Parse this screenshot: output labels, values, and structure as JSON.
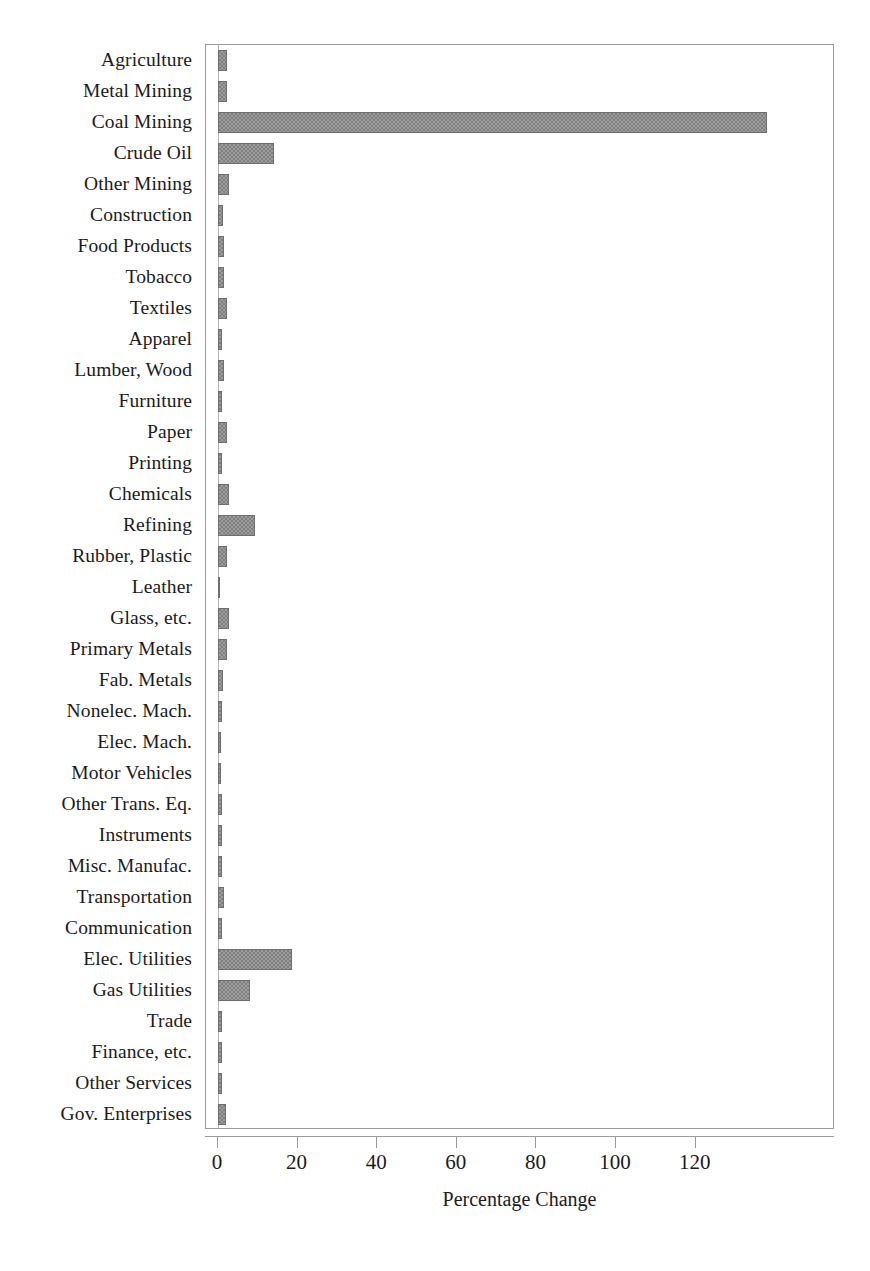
{
  "chart_data": {
    "type": "bar",
    "orientation": "horizontal",
    "title": "",
    "xlabel": "Percentage Change",
    "ylabel": "",
    "xlim": [
      -3,
      155
    ],
    "xticks": [
      0,
      20,
      40,
      60,
      80,
      100,
      120
    ],
    "grid": false,
    "legend": null,
    "bar_color": "#808080",
    "categories": [
      "Agriculture",
      "Metal Mining",
      "Coal Mining",
      "Crude Oil",
      "Other Mining",
      "Construction",
      "Food Products",
      "Tobacco",
      "Textiles",
      "Apparel",
      "Lumber, Wood",
      "Furniture",
      "Paper",
      "Printing",
      "Chemicals",
      "Refining",
      "Rubber, Plastic",
      "Leather",
      "Glass, etc.",
      "Primary Metals",
      "Fab. Metals",
      "Nonelec. Mach.",
      "Elec. Mach.",
      "Motor Vehicles",
      "Other Trans. Eq.",
      "Instruments",
      "Misc. Manufac.",
      "Transportation",
      "Communication",
      "Elec. Utilities",
      "Gas Utilities",
      "Trade",
      "Finance, etc.",
      "Other Services",
      "Gov. Enterprises"
    ],
    "values": [
      2.2,
      2.4,
      138.0,
      14.0,
      2.8,
      1.3,
      1.5,
      1.6,
      2.4,
      0.9,
      1.4,
      1.1,
      2.3,
      1.0,
      2.7,
      9.3,
      2.3,
      0.4,
      2.7,
      2.4,
      1.2,
      1.0,
      0.8,
      0.8,
      1.1,
      1.0,
      0.9,
      1.5,
      1.1,
      18.5,
      8.0,
      1.0,
      0.9,
      1.0,
      1.9
    ]
  },
  "axis": {
    "x_title": "Percentage Change",
    "tick_labels": [
      "0",
      "20",
      "40",
      "60",
      "80",
      "100",
      "120"
    ]
  },
  "caption": ""
}
